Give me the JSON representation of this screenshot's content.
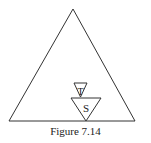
{
  "figure": {
    "caption": "Figure 7.14",
    "outer_triangle": {
      "points": "73,9 9,121 135,121"
    },
    "triangle_t": {
      "label": "T",
      "points": "74,83 87,83 80.5,97",
      "label_x": 80.5,
      "label_y": 95
    },
    "triangle_s": {
      "label": "S",
      "points": "71,98 101,98 86,121",
      "label_x": 86,
      "label_y": 112
    },
    "colors": {
      "stroke": "#333333",
      "text": "#222222",
      "background": "#ffffff"
    }
  }
}
